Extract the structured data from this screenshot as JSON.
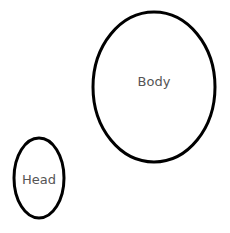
{
  "diagram": {
    "nodes": [
      {
        "id": "body",
        "label": "Body",
        "shape": "ellipse",
        "cx": 154,
        "cy": 87,
        "rx": 61,
        "ry": 75
      },
      {
        "id": "head",
        "label": "Head",
        "shape": "ellipse",
        "cx": 39,
        "cy": 178,
        "rx": 25,
        "ry": 40
      }
    ],
    "colors": {
      "stroke": "#000000",
      "text": "#555555",
      "background": "#ffffff"
    }
  }
}
